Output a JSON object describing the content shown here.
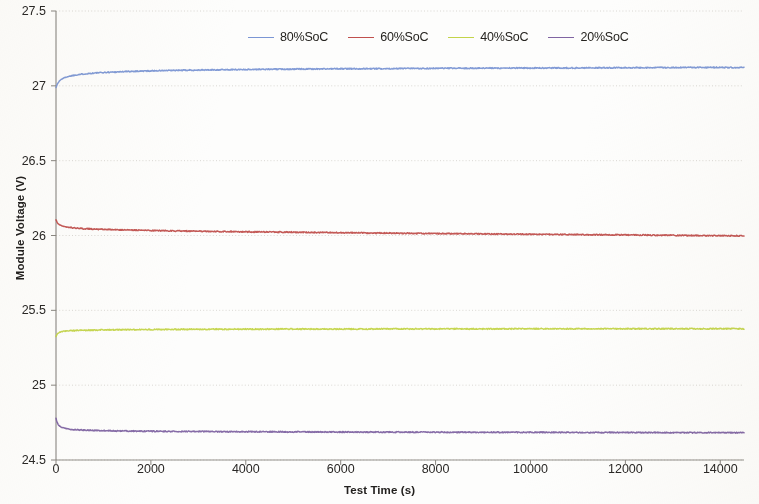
{
  "chart_data": {
    "type": "line",
    "title": "",
    "xlabel": "Test Time (s)",
    "ylabel": "Module Voltage (V)",
    "xlim": [
      0,
      14500
    ],
    "ylim": [
      24.5,
      27.5
    ],
    "xticks": [
      0,
      2000,
      4000,
      6000,
      8000,
      10000,
      12000,
      14000
    ],
    "xtick_labels": [
      "0",
      "2000",
      "4000",
      "6000",
      "8000",
      "10000",
      "12000",
      "14000"
    ],
    "yticks": [
      24.5,
      25,
      25.5,
      26,
      26.5,
      27,
      27.5
    ],
    "ytick_labels": [
      "24.5",
      "25",
      "25.5",
      "26",
      "26.5",
      "27",
      "27.5"
    ],
    "grid": true,
    "grid_axis": "y",
    "legend_position": "top-center",
    "series": [
      {
        "name": "80%SoC",
        "color": "#7b96d4",
        "x": [
          0,
          20,
          40,
          70,
          110,
          160,
          230,
          330,
          460,
          640,
          880,
          1200,
          1600,
          2100,
          2700,
          3400,
          4200,
          5000,
          6000,
          7000,
          8000,
          9000,
          10000,
          11000,
          12000,
          13000,
          14000,
          14400
        ],
        "y": [
          26.99,
          27.005,
          27.018,
          27.032,
          27.043,
          27.052,
          27.06,
          27.068,
          27.075,
          27.081,
          27.087,
          27.092,
          27.097,
          27.101,
          27.104,
          27.107,
          27.11,
          27.112,
          27.114,
          27.115,
          27.117,
          27.118,
          27.119,
          27.12,
          27.121,
          27.122,
          27.123,
          27.123
        ]
      },
      {
        "name": "60%SoC",
        "color": "#c0504d",
        "x": [
          0,
          20,
          40,
          70,
          110,
          160,
          230,
          330,
          460,
          640,
          880,
          1200,
          1600,
          2100,
          2700,
          3400,
          4200,
          5000,
          6000,
          7000,
          8000,
          9000,
          10000,
          11000,
          12000,
          13000,
          14000,
          14400
        ],
        "y": [
          26.105,
          26.09,
          26.08,
          26.072,
          26.066,
          26.061,
          26.056,
          26.052,
          26.048,
          26.045,
          26.042,
          26.039,
          26.036,
          26.033,
          26.03,
          26.027,
          26.024,
          26.022,
          26.019,
          26.016,
          26.013,
          26.011,
          26.008,
          26.006,
          26.004,
          26.001,
          25.999,
          25.998
        ]
      },
      {
        "name": "40%SoC",
        "color": "#c3d449",
        "x": [
          0,
          20,
          40,
          70,
          110,
          160,
          230,
          330,
          460,
          640,
          880,
          1200,
          1600,
          2100,
          2700,
          3400,
          4200,
          5000,
          6000,
          7000,
          8000,
          9000,
          10000,
          11000,
          12000,
          13000,
          14000,
          14400
        ],
        "y": [
          25.325,
          25.338,
          25.347,
          25.353,
          25.357,
          25.36,
          25.362,
          25.364,
          25.366,
          25.367,
          25.369,
          25.37,
          25.371,
          25.372,
          25.373,
          25.374,
          25.374,
          25.375,
          25.375,
          25.376,
          25.376,
          25.376,
          25.377,
          25.377,
          25.377,
          25.377,
          25.377,
          25.377
        ]
      },
      {
        "name": "20%SoC",
        "color": "#8064a2",
        "x": [
          0,
          20,
          40,
          70,
          110,
          160,
          230,
          330,
          460,
          640,
          880,
          1200,
          1600,
          2100,
          2700,
          3400,
          4200,
          5000,
          6000,
          7000,
          8000,
          9000,
          10000,
          11000,
          12000,
          13000,
          14000,
          14400
        ],
        "y": [
          24.78,
          24.755,
          24.74,
          24.728,
          24.72,
          24.714,
          24.709,
          24.705,
          24.702,
          24.699,
          24.697,
          24.695,
          24.693,
          24.692,
          24.691,
          24.69,
          24.689,
          24.688,
          24.687,
          24.686,
          24.686,
          24.685,
          24.685,
          24.684,
          24.684,
          24.683,
          24.683,
          24.683
        ]
      }
    ]
  },
  "legend": {
    "items": [
      {
        "label": "80%SoC",
        "color": "#7b96d4"
      },
      {
        "label": "60%SoC",
        "color": "#c0504d"
      },
      {
        "label": "40%SoC",
        "color": "#c3d449"
      },
      {
        "label": "20%SoC",
        "color": "#8064a2"
      }
    ]
  },
  "axes": {
    "x_title": "Test Time (s)",
    "y_title": "Module Voltage (V)"
  }
}
